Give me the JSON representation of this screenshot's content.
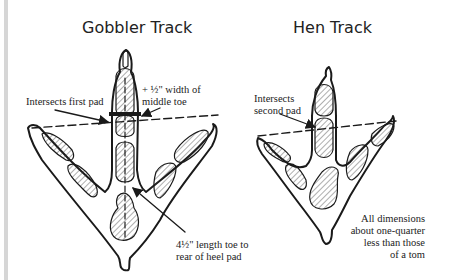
{
  "diagram": {
    "gobbler": {
      "title": "Gobbler Track",
      "labels": {
        "intersects": "Intersects first pad",
        "width_line1": "+ ½\" width of",
        "width_line2": "middle toe",
        "length_line1": "4½\" length toe to",
        "length_line2": "rear of heel pad"
      }
    },
    "hen": {
      "title": "Hen Track",
      "labels": {
        "intersects_line1": "Intersects",
        "intersects_line2": "second pad",
        "note_line1": "All dimensions",
        "note_line2": "about one-quarter",
        "note_line3": "less than those",
        "note_line4": "of a tom"
      }
    },
    "colors": {
      "ink": "#1a1a1a",
      "background": "#ffffff",
      "edge_bar": "#d6d6d6"
    }
  }
}
